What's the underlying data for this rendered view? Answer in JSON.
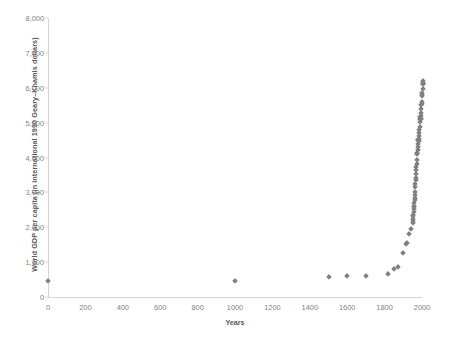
{
  "chart_data": {
    "type": "scatter",
    "title": "",
    "xlabel": "Years",
    "ylabel": "World GDP per capita (in international 1990 Geary–Khamis dollars)",
    "xlim": [
      0,
      2000
    ],
    "ylim": [
      0,
      8000
    ],
    "xticks": [
      0,
      200,
      400,
      600,
      800,
      1000,
      1200,
      1400,
      1600,
      1800,
      2000
    ],
    "xtick_labels": [
      "0",
      "200",
      "400",
      "600",
      "800",
      "1000",
      "1200",
      "1400",
      "1600",
      "1800",
      "2000"
    ],
    "yticks": [
      0,
      1000,
      2000,
      3000,
      4000,
      5000,
      6000,
      7000,
      8000
    ],
    "ytick_labels": [
      "0",
      "1,000",
      "2,000",
      "3,000",
      "4,000",
      "5,000",
      "6,000",
      "7,000",
      "8,000"
    ],
    "grid": false,
    "legend": false,
    "marker": "diamond",
    "marker_color": "#808080",
    "series": [
      {
        "name": "World GDP per capita",
        "x": [
          1,
          1000,
          1500,
          1600,
          1700,
          1820,
          1850,
          1870,
          1900,
          1913,
          1920,
          1930,
          1940,
          1950,
          1951,
          1952,
          1953,
          1954,
          1955,
          1956,
          1957,
          1958,
          1959,
          1960,
          1961,
          1962,
          1963,
          1964,
          1965,
          1966,
          1967,
          1968,
          1969,
          1970,
          1971,
          1972,
          1973,
          1974,
          1975,
          1976,
          1977,
          1978,
          1979,
          1980,
          1981,
          1982,
          1983,
          1984,
          1985,
          1986,
          1987,
          1988,
          1989,
          1990,
          1991,
          1992,
          1993,
          1994,
          1995,
          1996,
          1997,
          1998,
          1999,
          2000,
          2001,
          2002,
          2003,
          2004,
          2005,
          2006,
          2007,
          2008
        ],
        "y": [
          467,
          450,
          566,
          596,
          616,
          667,
          792,
          873,
          1261,
          1524,
          1539,
          1805,
          1958,
          2111,
          2186,
          2241,
          2320,
          2356,
          2450,
          2525,
          2570,
          2600,
          2700,
          2773,
          2837,
          2927,
          3015,
          3140,
          3247,
          3346,
          3403,
          3528,
          3655,
          3736,
          3802,
          3923,
          4091,
          4122,
          4109,
          4225,
          4305,
          4391,
          4497,
          4511,
          4512,
          4477,
          4522,
          4621,
          4713,
          4789,
          4874,
          5010,
          5110,
          5150,
          5098,
          5090,
          5096,
          5180,
          5283,
          5382,
          5500,
          5520,
          5602,
          5757,
          5790,
          5850,
          5950,
          6100,
          6120,
          6150,
          6180,
          6120
        ]
      }
    ]
  },
  "axes": {
    "y_title": "World GDP per capita (in international 1990 Geary–Khamis dollars)",
    "x_title": "Years"
  },
  "colors": {
    "marker": "#808080",
    "axis": "#d4d4d4",
    "tick_text": "#7f7f7f",
    "title_text": "#595959",
    "background": "#ffffff"
  }
}
